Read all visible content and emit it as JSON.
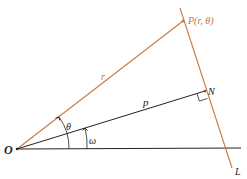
{
  "diagram": {
    "colors": {
      "orange": "#c9793f",
      "black": "#222222",
      "label_orange": "#b9744a"
    },
    "labels": {
      "origin": "O",
      "point_P": "P(r, θ)",
      "point_N": "N",
      "line_L": "L",
      "segment_r": "r",
      "segment_p": "p",
      "angle_theta": "θ",
      "angle_omega": "ω"
    },
    "points": {
      "O": [
        17,
        149
      ],
      "P": [
        183,
        21
      ],
      "N": [
        205,
        91
      ]
    }
  }
}
